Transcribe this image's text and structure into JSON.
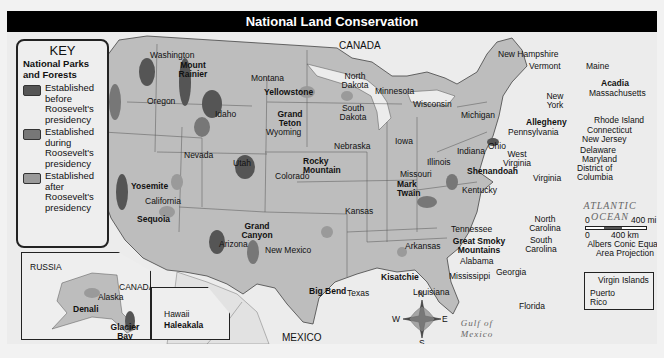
{
  "title": "National Land Conservation",
  "colors": {
    "before": "#555555",
    "during": "#777777",
    "after": "#9a9a9a",
    "land": "#bdbdbd",
    "water": "#ececec",
    "title_bg": "#000000"
  },
  "key": {
    "title": "KEY",
    "subtitle": "National Parks and Forests",
    "items": [
      {
        "label": "Established before Roosevelt's presidency",
        "color": "#555555"
      },
      {
        "label": "Established during Roosevelt's presidency",
        "color": "#777777"
      },
      {
        "label": "Established after Roosevelt's presidency",
        "color": "#9a9a9a"
      }
    ]
  },
  "oceans": {
    "pacific": "PACIFIC OCEAN",
    "atlantic": "ATLANTIC OCEAN",
    "gulf": "Gulf of Mexico"
  },
  "countries": {
    "canada": "CANADA",
    "mexico": "MEXICO",
    "russia": "RUSSIA",
    "canada_inset": "CANADA"
  },
  "states": {
    "washington": "Washington",
    "oregon": "Oregon",
    "california": "California",
    "idaho": "Idaho",
    "nevada": "Nevada",
    "montana": "Montana",
    "wyoming": "Wyoming",
    "utah": "Utah",
    "colorado": "Colorado",
    "arizona": "Arizona",
    "new_mexico": "New Mexico",
    "north_dakota": "North Dakota",
    "south_dakota": "South Dakota",
    "nebraska": "Nebraska",
    "kansas": "Kansas",
    "oklahoma": "Oklahoma",
    "texas": "Texas",
    "minnesota": "Minnesota",
    "iowa": "Iowa",
    "missouri": "Missouri",
    "arkansas": "Arkansas",
    "louisiana": "Louisiana",
    "wisconsin": "Wisconsin",
    "illinois": "Illinois",
    "michigan": "Michigan",
    "indiana": "Indiana",
    "ohio": "Ohio",
    "kentucky": "Kentucky",
    "tennessee": "Tennessee",
    "mississippi": "Mississippi",
    "alabama": "Alabama",
    "georgia": "Georgia",
    "florida": "Florida",
    "south_carolina": "South Carolina",
    "north_carolina": "North Carolina",
    "virginia": "Virginia",
    "west_virginia": "West Virginia",
    "pennsylvania": "Pennsylvania",
    "new_york": "New York",
    "vermont": "Vermont",
    "new_hampshire": "New Hampshire",
    "maine": "Maine",
    "massachusetts": "Massachusetts",
    "rhode_island": "Rhode Island",
    "connecticut": "Connecticut",
    "new_jersey": "New Jersey",
    "delaware": "Delaware",
    "maryland": "Maryland",
    "dc": "District of Columbia",
    "alaska": "Alaska",
    "hawaii": "Hawaii",
    "puerto_rico": "Puerto Rico",
    "virgin_islands": "Virgin Islands"
  },
  "parks": {
    "mount_rainier": "Mount Rainier",
    "yellowstone": "Yellowstone",
    "grand_teton": "Grand Teton",
    "yosemite": "Yosemite",
    "sequoia": "Sequoia",
    "rocky_mountain": "Rocky Mountain",
    "grand_canyon": "Grand Canyon",
    "big_bend": "Big Bend",
    "kisatchie": "Kisatchie",
    "mark_twain": "Mark Twain",
    "great_smoky": "Great Smoky Mountains",
    "shenandoah": "Shenandoah",
    "allegheny": "Allegheny",
    "acadia": "Acadia",
    "denali": "Denali",
    "glacier_bay": "Glacier Bay",
    "haleakala": "Haleakala"
  },
  "scale": {
    "mi_zero": "0",
    "mi_value": "400 mi",
    "km_zero": "0",
    "km_value": "400 km",
    "projection": "Albers Conic Equal-Area Projection"
  },
  "compass": {
    "n": "N",
    "s": "S",
    "e": "E",
    "w": "W"
  }
}
